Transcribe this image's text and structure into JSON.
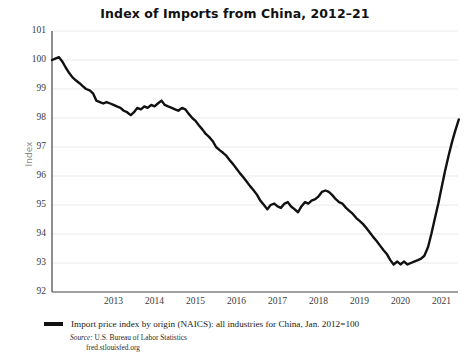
{
  "chart_data": {
    "type": "line",
    "title": "Index of Imports from China, 2012–21",
    "xlabel": "",
    "ylabel": "Index",
    "ylim": [
      92,
      101
    ],
    "xlim": [
      2012.0,
      2021.9
    ],
    "grid": true,
    "legend_position": "below-plot",
    "y_ticks": [
      101,
      100,
      99,
      98,
      97,
      96,
      95,
      94,
      93,
      92
    ],
    "x_ticks": [
      2013,
      2014,
      2015,
      2016,
      2017,
      2018,
      2019,
      2020,
      2021
    ],
    "series": [
      {
        "name": "Import price index by origin (NAICS): all industries for China, Jan. 2012=100",
        "color": "#111111",
        "x": [
          2012.0,
          2012.08,
          2012.17,
          2012.25,
          2012.33,
          2012.42,
          2012.5,
          2012.58,
          2012.67,
          2012.75,
          2012.83,
          2012.92,
          2013.0,
          2013.08,
          2013.17,
          2013.25,
          2013.33,
          2013.42,
          2013.5,
          2013.58,
          2013.67,
          2013.75,
          2013.83,
          2013.92,
          2014.0,
          2014.08,
          2014.17,
          2014.25,
          2014.33,
          2014.42,
          2014.5,
          2014.58,
          2014.67,
          2014.75,
          2014.83,
          2014.92,
          2015.0,
          2015.08,
          2015.17,
          2015.25,
          2015.33,
          2015.42,
          2015.5,
          2015.58,
          2015.67,
          2015.75,
          2015.83,
          2015.92,
          2016.0,
          2016.08,
          2016.17,
          2016.25,
          2016.33,
          2016.42,
          2016.5,
          2016.58,
          2016.67,
          2016.75,
          2016.83,
          2016.92,
          2017.0,
          2017.08,
          2017.17,
          2017.25,
          2017.33,
          2017.42,
          2017.5,
          2017.58,
          2017.67,
          2017.75,
          2017.83,
          2017.92,
          2018.0,
          2018.08,
          2018.17,
          2018.25,
          2018.33,
          2018.42,
          2018.5,
          2018.58,
          2018.67,
          2018.75,
          2018.83,
          2018.92,
          2019.0,
          2019.08,
          2019.17,
          2019.25,
          2019.33,
          2019.42,
          2019.5,
          2019.58,
          2019.67,
          2019.75,
          2019.83,
          2019.92,
          2020.0,
          2020.08,
          2020.17,
          2020.25,
          2020.33,
          2020.42,
          2020.5,
          2020.58,
          2020.67,
          2020.75,
          2020.83,
          2020.92,
          2021.0,
          2021.08,
          2021.17,
          2021.25,
          2021.33,
          2021.42,
          2021.5,
          2021.58,
          2021.67,
          2021.75,
          2021.83,
          2021.92
        ],
        "values": [
          100.0,
          100.05,
          100.1,
          99.95,
          99.75,
          99.55,
          99.4,
          99.3,
          99.2,
          99.1,
          99.0,
          98.95,
          98.85,
          98.6,
          98.55,
          98.5,
          98.55,
          98.5,
          98.45,
          98.4,
          98.35,
          98.25,
          98.2,
          98.1,
          98.2,
          98.35,
          98.3,
          98.4,
          98.35,
          98.45,
          98.4,
          98.5,
          98.6,
          98.45,
          98.4,
          98.35,
          98.3,
          98.25,
          98.35,
          98.3,
          98.15,
          98.0,
          97.9,
          97.75,
          97.6,
          97.45,
          97.35,
          97.2,
          97.0,
          96.9,
          96.8,
          96.7,
          96.55,
          96.4,
          96.25,
          96.1,
          95.95,
          95.8,
          95.65,
          95.5,
          95.35,
          95.15,
          95.0,
          94.85,
          95.0,
          95.05,
          94.95,
          94.9,
          95.05,
          95.1,
          94.95,
          94.85,
          94.75,
          94.95,
          95.1,
          95.05,
          95.15,
          95.2,
          95.3,
          95.45,
          95.5,
          95.45,
          95.35,
          95.2,
          95.1,
          95.05,
          94.9,
          94.8,
          94.7,
          94.55,
          94.45,
          94.35,
          94.2,
          94.05,
          93.9,
          93.75,
          93.6,
          93.45,
          93.3,
          93.1,
          92.95,
          93.05,
          92.95,
          93.05,
          92.95,
          93.0,
          93.05,
          93.1,
          93.15,
          93.25,
          93.55,
          94.0,
          94.5,
          95.05,
          95.6,
          96.15,
          96.7,
          97.15,
          97.55,
          97.95
        ]
      }
    ],
    "source_prefix": "Source:",
    "source_name": "U.S. Bureau of Labor Statistics",
    "source_url": "fred.stlouisfed.org"
  },
  "axes": {
    "y_title": "Index"
  }
}
